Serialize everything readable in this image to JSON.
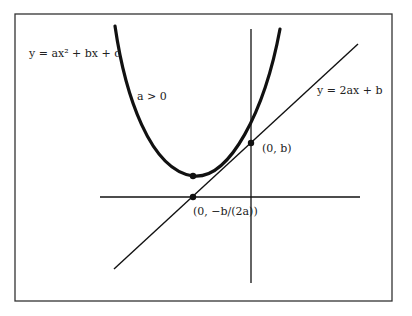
{
  "diagram": {
    "labels": {
      "parabola_eq": "y = ax² + bx + c",
      "condition": "a > 0",
      "line_eq": "y = 2ax + b",
      "y_intercept": "(0, b)",
      "x_point": "(0, −b/(2a))"
    },
    "colors": {
      "stroke": "#111111",
      "frame": "#333333",
      "background": "#ffffff"
    }
  }
}
